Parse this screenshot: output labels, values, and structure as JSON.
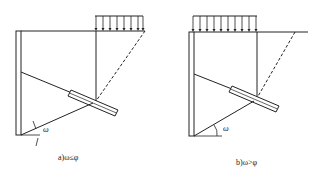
{
  "figure": {
    "panels": [
      {
        "id": "a",
        "caption": "a)ω≤φ",
        "angle_label": "ω",
        "elements": [
          "retaining-wall",
          "uniform-surcharge-load",
          "sliding-wedge-dashed-line",
          "anchor-rod",
          "anchor-body",
          "failure-plane"
        ]
      },
      {
        "id": "b",
        "caption": "b)ω>φ",
        "angle_label": "ω",
        "elements": [
          "retaining-wall",
          "uniform-surcharge-load",
          "sliding-wedge-dashed-line",
          "anchor-rod",
          "anchor-body",
          "failure-plane"
        ]
      }
    ],
    "colors": {
      "line": "#222222",
      "background": "#ffffff"
    }
  }
}
